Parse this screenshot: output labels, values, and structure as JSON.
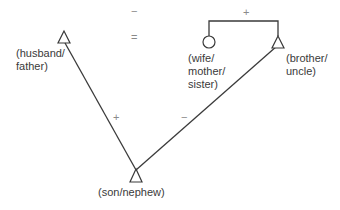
{
  "diagram": {
    "type": "kinship-balance-diagram",
    "nodes": [
      {
        "id": "husband_father",
        "shape": "triangle",
        "label": "(husband/\nfather)"
      },
      {
        "id": "wife_mother_sister",
        "shape": "circle",
        "label": "(wife/\nmother/\nsister)"
      },
      {
        "id": "brother_uncle",
        "shape": "triangle",
        "label": "(brother/\nuncle)"
      },
      {
        "id": "son_nephew",
        "shape": "triangle",
        "label": "(son/nephew)"
      }
    ],
    "relations": [
      {
        "from": "husband_father",
        "to": "wife_mother_sister",
        "type": "marriage",
        "sign": "−",
        "sign_label": "−",
        "marriage_symbol": "="
      },
      {
        "from": "wife_mother_sister",
        "to": "brother_uncle",
        "type": "sibling",
        "sign": "+"
      },
      {
        "from": "husband_father",
        "to": "son_nephew",
        "type": "father-son",
        "sign": "+"
      },
      {
        "from": "brother_uncle",
        "to": "son_nephew",
        "type": "mother's brother-sister's son",
        "sign": "−"
      }
    ],
    "signs": {
      "husband_wife": "−",
      "marriage": "=",
      "brother_sister": "+",
      "father_son": "+",
      "uncle_nephew": "−"
    },
    "labels": {
      "husband_father": "(husband/\nfather)",
      "wife_mother_sister": "(wife/\nmother/\nsister)",
      "brother_uncle": "(brother/\nuncle)",
      "son_nephew": "(son/nephew)"
    },
    "colors": {
      "line": "#3a3a3a",
      "sign": "#8a8a8a",
      "text": "#3a3a3a"
    }
  }
}
